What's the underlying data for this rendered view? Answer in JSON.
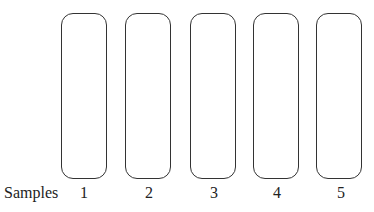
{
  "diagram": {
    "row_label": "Samples",
    "lanes": [
      {
        "label": "1"
      },
      {
        "label": "2"
      },
      {
        "label": "3"
      },
      {
        "label": "4"
      },
      {
        "label": "5"
      }
    ]
  }
}
